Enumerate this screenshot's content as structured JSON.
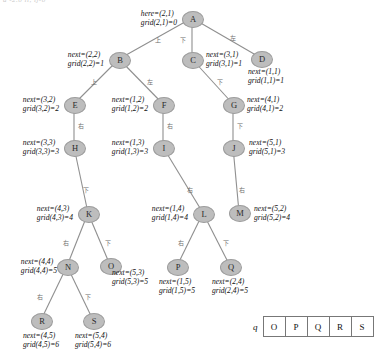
{
  "figure": {
    "top_fragment": "a -2.0 ii, ij-0",
    "node_fill": "#bdbdbd",
    "edge_color": "#8f8f8f"
  },
  "nodes": [
    {
      "id": "A",
      "label": "A",
      "x": 192,
      "y": 18
    },
    {
      "id": "B",
      "label": "B",
      "x": 119,
      "y": 59
    },
    {
      "id": "C",
      "label": "C",
      "x": 192,
      "y": 59
    },
    {
      "id": "D",
      "label": "D",
      "x": 261,
      "y": 58
    },
    {
      "id": "E",
      "label": "E",
      "x": 74,
      "y": 104
    },
    {
      "id": "F",
      "label": "F",
      "x": 163,
      "y": 104
    },
    {
      "id": "G",
      "label": "G",
      "x": 233,
      "y": 104
    },
    {
      "id": "H",
      "label": "H",
      "x": 74,
      "y": 147
    },
    {
      "id": "I",
      "label": "I",
      "x": 163,
      "y": 147
    },
    {
      "id": "J",
      "label": "J",
      "x": 233,
      "y": 147
    },
    {
      "id": "K",
      "label": "K",
      "x": 88,
      "y": 213
    },
    {
      "id": "L",
      "label": "L",
      "x": 203,
      "y": 213
    },
    {
      "id": "M",
      "label": "M",
      "x": 239,
      "y": 212
    },
    {
      "id": "N",
      "label": "N",
      "x": 67,
      "y": 266
    },
    {
      "id": "O",
      "label": "O",
      "x": 110,
      "y": 265
    },
    {
      "id": "P",
      "label": "P",
      "x": 177,
      "y": 266
    },
    {
      "id": "Q",
      "label": "Q",
      "x": 230,
      "y": 266
    },
    {
      "id": "R",
      "label": "R",
      "x": 41,
      "y": 320
    },
    {
      "id": "S",
      "label": "S",
      "x": 93,
      "y": 320
    }
  ],
  "edges": [
    {
      "from": "A",
      "to": "B",
      "label": "上"
    },
    {
      "from": "A",
      "to": "C",
      "label": "下"
    },
    {
      "from": "A",
      "to": "D",
      "label": "左"
    },
    {
      "from": "B",
      "to": "E",
      "label": "上"
    },
    {
      "from": "B",
      "to": "F",
      "label": "左"
    },
    {
      "from": "C",
      "to": "G",
      "label": "下"
    },
    {
      "from": "E",
      "to": "H",
      "label": "右"
    },
    {
      "from": "F",
      "to": "I",
      "label": "右"
    },
    {
      "from": "G",
      "to": "J",
      "label": "下"
    },
    {
      "from": "H",
      "to": "K",
      "label": "下"
    },
    {
      "from": "I",
      "to": "L",
      "label": "右"
    },
    {
      "from": "J",
      "to": "M",
      "label": "右"
    },
    {
      "from": "K",
      "to": "N",
      "label": "右"
    },
    {
      "from": "K",
      "to": "O",
      "label": "下"
    },
    {
      "from": "L",
      "to": "P",
      "label": "右"
    },
    {
      "from": "L",
      "to": "Q",
      "label": "下"
    },
    {
      "from": "N",
      "to": "R",
      "label": "右"
    },
    {
      "from": "N",
      "to": "S",
      "label": "下"
    }
  ],
  "edge_label_positions": [
    {
      "id": "A-B",
      "x": 158,
      "y": 40
    },
    {
      "id": "A-C",
      "x": 183,
      "y": 40
    },
    {
      "id": "A-D",
      "x": 233,
      "y": 38
    },
    {
      "id": "B-E",
      "x": 94,
      "y": 82
    },
    {
      "id": "B-F",
      "x": 150,
      "y": 82
    },
    {
      "id": "C-G",
      "x": 220,
      "y": 82
    },
    {
      "id": "E-H",
      "x": 81,
      "y": 126
    },
    {
      "id": "F-I",
      "x": 170,
      "y": 126
    },
    {
      "id": "G-J",
      "x": 240,
      "y": 126
    },
    {
      "id": "H-K",
      "x": 86,
      "y": 190
    },
    {
      "id": "I-L",
      "x": 190,
      "y": 190
    },
    {
      "id": "J-M",
      "x": 242,
      "y": 190
    },
    {
      "id": "K-N",
      "x": 66,
      "y": 243
    },
    {
      "id": "K-O",
      "x": 108,
      "y": 243
    },
    {
      "id": "L-P",
      "x": 181,
      "y": 243
    },
    {
      "id": "L-Q",
      "x": 226,
      "y": 243
    },
    {
      "id": "N-R",
      "x": 40,
      "y": 297
    },
    {
      "id": "N-S",
      "x": 88,
      "y": 297
    }
  ],
  "annotations": [
    {
      "for": "A",
      "line1": "here=(2,1)",
      "line2": "grid(2,1)=0",
      "x": 177,
      "y": 18,
      "align": "r",
      "name": "annotation-a"
    },
    {
      "for": "B",
      "line1": "next=(2,2)",
      "line2": "grid(2,2)=1",
      "x": 104,
      "y": 59,
      "align": "r",
      "name": "annotation-b"
    },
    {
      "for": "C",
      "line1": "next=(3,1)",
      "line2": "grid(3,1)=1",
      "x": 206,
      "y": 59,
      "align": "l",
      "name": "annotation-c"
    },
    {
      "for": "D",
      "line1": "next=(1,1)",
      "line2": "grid(1,1)=1",
      "x": 248,
      "y": 76,
      "align": "l",
      "name": "annotation-d"
    },
    {
      "for": "E",
      "line1": "next=(3,2)",
      "line2": "grid(3,2)=2",
      "x": 59,
      "y": 104,
      "align": "r",
      "name": "annotation-e"
    },
    {
      "for": "F",
      "line1": "next=(1,2)",
      "line2": "grid(1,2)=2",
      "x": 148,
      "y": 104,
      "align": "r",
      "name": "annotation-f"
    },
    {
      "for": "G",
      "line1": "next=(4,1)",
      "line2": "grid(4,1)=2",
      "x": 247,
      "y": 104,
      "align": "l",
      "name": "annotation-g"
    },
    {
      "for": "H",
      "line1": "next=(3,3)",
      "line2": "grid(3,3)=3",
      "x": 59,
      "y": 147,
      "align": "r",
      "name": "annotation-h"
    },
    {
      "for": "I",
      "line1": "next=(1,3)",
      "line2": "grid(1,3)=3",
      "x": 148,
      "y": 147,
      "align": "r",
      "name": "annotation-i"
    },
    {
      "for": "J",
      "line1": "next=(5,1)",
      "line2": "grid(5,1)=3",
      "x": 249,
      "y": 147,
      "align": "l",
      "name": "annotation-j"
    },
    {
      "for": "K",
      "line1": "next=(4,3)",
      "line2": "grid(4,3)=4",
      "x": 73,
      "y": 213,
      "align": "r",
      "name": "annotation-k"
    },
    {
      "for": "L",
      "line1": "next=(1,4)",
      "line2": "grid(1,4)=4",
      "x": 188,
      "y": 213,
      "align": "r",
      "name": "annotation-l"
    },
    {
      "for": "M",
      "line1": "next=(5,2)",
      "line2": "grid(5,2)=4",
      "x": 254,
      "y": 213,
      "align": "l",
      "name": "annotation-m"
    },
    {
      "for": "N",
      "line1": "next=(4,4)",
      "line2": "grid(4,4)=5",
      "x": 57,
      "y": 266,
      "align": "r",
      "name": "annotation-n"
    },
    {
      "for": "O",
      "line1": "next=(5,3)",
      "line2": "grid(5,3)=5",
      "x": 112,
      "y": 277,
      "align": "l",
      "name": "annotation-o"
    },
    {
      "for": "P",
      "line1": "next=(1,5)",
      "line2": "grid(1,5)=5",
      "x": 177,
      "y": 277,
      "align": "c",
      "name": "annotation-p"
    },
    {
      "for": "Q",
      "line1": "next=(2,4)",
      "line2": "grid(2,4)=5",
      "x": 230,
      "y": 277,
      "align": "c",
      "name": "annotation-q"
    },
    {
      "for": "R",
      "line1": "next=(4,5)",
      "line2": "grid(4,5)=6",
      "x": 41,
      "y": 331,
      "align": "c",
      "name": "annotation-r"
    },
    {
      "for": "S",
      "line1": "next=(5,4)",
      "line2": "grid(5,4)=6",
      "x": 93,
      "y": 331,
      "align": "c",
      "name": "annotation-s"
    }
  ],
  "queue": {
    "name": "q",
    "cells": [
      "O",
      "P",
      "Q",
      "R",
      "S"
    ],
    "x": 253,
    "y": 316
  }
}
